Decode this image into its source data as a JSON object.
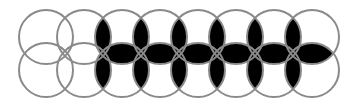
{
  "diagram": {
    "type": "overlapping-circles-pattern",
    "rows": 2,
    "columns": 8,
    "radius": 27,
    "column_centers_x": [
      46,
      84,
      122,
      160,
      198,
      236,
      274,
      312
    ],
    "row_centers_y": [
      37,
      70
    ],
    "circle_stroke": "#8a8a8a",
    "fill_color": "#000000",
    "background": "#ffffff",
    "filled_vertical_lens_columns_between": [
      [
        1,
        2
      ],
      [
        2,
        3
      ],
      [
        3,
        4
      ],
      [
        4,
        5
      ],
      [
        5,
        6
      ],
      [
        6,
        7
      ]
    ],
    "filled_horizontal_lens_columns": [
      2,
      3,
      4,
      5,
      6,
      7
    ]
  }
}
